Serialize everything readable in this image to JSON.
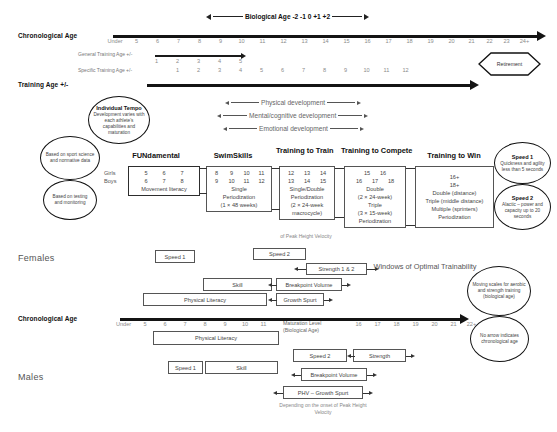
{
  "top": {
    "chronological_age_label": "Chronological Age",
    "training_age_label": "Training Age +/-",
    "biological_age_header": "Biological Age  -2 -1 0 +1 +2",
    "general_training_age_label": "General Training Age +/-",
    "specific_training_age_label": "Specific Training Age +/-",
    "age_scale": [
      "Under",
      "5",
      "6",
      "7",
      "8",
      "9",
      "10",
      "11",
      "12",
      "13",
      "14",
      "15",
      "16",
      "17",
      "18",
      "19",
      "20",
      "21",
      "22",
      "23",
      "24+"
    ],
    "general_training_numbers": [
      "1",
      "2",
      "3",
      "4",
      "5"
    ],
    "specific_training_numbers": [
      "1",
      "2",
      "3",
      "4",
      "5",
      "6",
      "7",
      "8",
      "9",
      "10",
      "11",
      "12"
    ],
    "retirement_label": "Retirement"
  },
  "development_arrows": [
    {
      "label": "Physical development"
    },
    {
      "label": "Mental/cognitive development"
    },
    {
      "label": "Emotional development"
    }
  ],
  "individual_tempo": {
    "title": "Individual Tempo",
    "text": "Development varies with each athlete's capabilities and maturation"
  },
  "left_circles": [
    {
      "text": "Based on sport science and normative data"
    },
    {
      "text": "Based on testing and monitoring"
    }
  ],
  "right_circles": [
    {
      "title": "Speed 1",
      "text": "Quickness and agility less than 5 seconds"
    },
    {
      "title": "Speed 2",
      "text": "Alactic – power and capacity up to 20 seconds"
    }
  ],
  "bottom_right_circles": [
    {
      "text": "Moving scales for aerobic and strength training (biological age)"
    },
    {
      "text": "No arrow indicates chronological age"
    }
  ],
  "gender_row_labels": {
    "girls": "Girls",
    "boys": "Boys"
  },
  "stages": [
    {
      "name": "FUNdamental",
      "girls": [
        "5",
        "6",
        "7"
      ],
      "boys": [
        "6",
        "7",
        "8"
      ],
      "lines": [
        "Movement literacy"
      ]
    },
    {
      "name": "SwimSkills",
      "girls": [
        "8",
        "9",
        "10",
        "11"
      ],
      "boys": [
        "9",
        "10",
        "11",
        "12"
      ],
      "lines": [
        "Single",
        "Periodization",
        "(1 × 48 weeks)"
      ]
    },
    {
      "name": "Training to Train",
      "girls": [
        "12",
        "13",
        "14"
      ],
      "boys": [
        "13",
        "14",
        "15"
      ],
      "lines": [
        "Single/Double",
        "Periodization",
        "(2 × 24-week",
        "macrocycle)"
      ]
    },
    {
      "name": "Training to Compete",
      "girls": [
        "15",
        "16"
      ],
      "boys": [
        "16",
        "17",
        "18"
      ],
      "lines": [
        "Double",
        "(2 × 24-week)",
        "Triple",
        "(3 × 15-week)",
        "Periodization"
      ]
    },
    {
      "name": "Training to Win",
      "girls": [
        "16+"
      ],
      "boys": [
        "18+"
      ],
      "lines": [
        "Double (distance)",
        "Triple (middle distance)",
        "Multiple (sprinters)",
        "Periodization"
      ]
    }
  ],
  "phv_caption_top": "of Peak Height Velocity",
  "females": {
    "label": "Females",
    "boxes": [
      {
        "text": "Speed 1"
      },
      {
        "text": "Speed 2"
      },
      {
        "text": "Strength 1 & 2"
      },
      {
        "text": "Skill"
      },
      {
        "text": "Breakpoint Volume"
      },
      {
        "text": "Physical Literacy"
      },
      {
        "text": "Growth Spurt"
      }
    ]
  },
  "windows_label": "Windows of Optimal Trainability",
  "bottom_axis": {
    "chronological_age_label": "Chronological Age",
    "left_ticks": [
      "Under",
      "5",
      "6",
      "7",
      "8",
      "9",
      "10",
      "11"
    ],
    "maturation_label": "Maturation Level (Biological Age)",
    "right_ticks": [
      "16",
      "17",
      "18",
      "19",
      "20",
      "21",
      "22+"
    ]
  },
  "males": {
    "label": "Males",
    "boxes": [
      {
        "text": "Physical Literacy"
      },
      {
        "text": "Speed 1"
      },
      {
        "text": "Skill"
      },
      {
        "text": "Speed 2"
      },
      {
        "text": "Strength"
      },
      {
        "text": "Breakpoint Volume"
      },
      {
        "text": "PHV – Growth Spurt"
      }
    ],
    "caption": "Depending on the onset of Peak Height Velocity"
  }
}
